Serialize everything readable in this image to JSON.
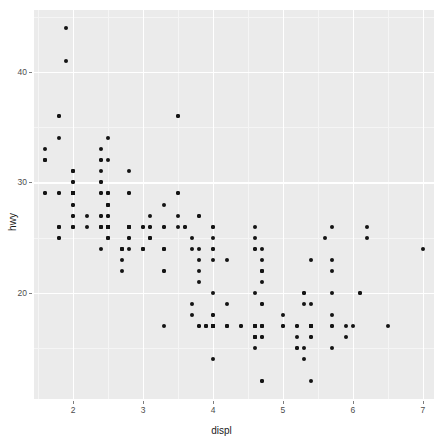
{
  "chart_data": {
    "type": "scatter",
    "title": "",
    "subtitle": "",
    "xlabel": "displ",
    "ylabel": "hwy",
    "xlim": [
      1.44,
      7.16
    ],
    "ylim": [
      10.4,
      45.6
    ],
    "xticks": [
      2,
      3,
      4,
      5,
      6,
      7
    ],
    "xtick_labels": [
      "2",
      "3",
      "4",
      "5",
      "6",
      "7"
    ],
    "yticks": [
      20,
      30,
      40
    ],
    "ytick_labels": [
      "20",
      "30",
      "40"
    ],
    "x_minor_ticks": [
      1.5,
      2.5,
      3.5,
      4.5,
      5.5,
      6.5
    ],
    "y_minor_ticks": [
      15,
      25,
      35,
      45
    ],
    "grid": true,
    "legend": "none",
    "point_color": "#141414",
    "panel_background": "#ebebeb",
    "gridline_color": "#ffffff",
    "figure_background": "#ffffff",
    "n_points": 234,
    "series_name": "mpg",
    "points": [
      [
        1.8,
        29
      ],
      [
        1.8,
        29
      ],
      [
        2.0,
        31
      ],
      [
        2.0,
        30
      ],
      [
        2.8,
        26
      ],
      [
        2.8,
        26
      ],
      [
        3.1,
        27
      ],
      [
        1.8,
        26
      ],
      [
        1.8,
        25
      ],
      [
        2.0,
        28
      ],
      [
        2.0,
        27
      ],
      [
        2.8,
        25
      ],
      [
        2.8,
        25
      ],
      [
        3.1,
        25
      ],
      [
        3.1,
        25
      ],
      [
        2.8,
        24
      ],
      [
        3.1,
        25
      ],
      [
        4.2,
        23
      ],
      [
        5.3,
        20
      ],
      [
        5.3,
        15
      ],
      [
        5.3,
        20
      ],
      [
        5.7,
        17
      ],
      [
        6.0,
        17
      ],
      [
        5.7,
        26
      ],
      [
        5.7,
        23
      ],
      [
        6.2,
        26
      ],
      [
        6.2,
        25
      ],
      [
        7.0,
        24
      ],
      [
        5.3,
        19
      ],
      [
        5.3,
        14
      ],
      [
        5.7,
        15
      ],
      [
        6.5,
        17
      ],
      [
        2.4,
        27
      ],
      [
        2.4,
        30
      ],
      [
        3.1,
        26
      ],
      [
        3.5,
        29
      ],
      [
        3.6,
        26
      ],
      [
        2.4,
        24
      ],
      [
        3.0,
        24
      ],
      [
        3.3,
        22
      ],
      [
        3.3,
        22
      ],
      [
        3.3,
        24
      ],
      [
        3.3,
        24
      ],
      [
        3.3,
        17
      ],
      [
        3.8,
        22
      ],
      [
        3.8,
        21
      ],
      [
        3.8,
        23
      ],
      [
        4.0,
        23
      ],
      [
        3.7,
        19
      ],
      [
        3.7,
        18
      ],
      [
        3.9,
        17
      ],
      [
        3.9,
        17
      ],
      [
        4.7,
        19
      ],
      [
        4.7,
        19
      ],
      [
        4.7,
        12
      ],
      [
        5.2,
        17
      ],
      [
        5.2,
        15
      ],
      [
        3.9,
        17
      ],
      [
        4.7,
        17
      ],
      [
        4.7,
        12
      ],
      [
        4.7,
        17
      ],
      [
        5.2,
        16
      ],
      [
        5.7,
        18
      ],
      [
        5.9,
        17
      ],
      [
        4.7,
        17
      ],
      [
        4.7,
        16
      ],
      [
        4.7,
        16
      ],
      [
        4.7,
        17
      ],
      [
        5.2,
        15
      ],
      [
        5.2,
        17
      ],
      [
        5.7,
        17
      ],
      [
        5.9,
        16
      ],
      [
        4.6,
        17
      ],
      [
        5.4,
        17
      ],
      [
        5.4,
        16
      ],
      [
        4.0,
        20
      ],
      [
        4.0,
        17
      ],
      [
        4.0,
        17
      ],
      [
        4.0,
        17
      ],
      [
        4.6,
        17
      ],
      [
        5.0,
        17
      ],
      [
        4.2,
        17
      ],
      [
        4.2,
        17
      ],
      [
        4.6,
        16
      ],
      [
        4.6,
        16
      ],
      [
        4.6,
        16
      ],
      [
        5.4,
        17
      ],
      [
        5.4,
        17
      ],
      [
        3.8,
        17
      ],
      [
        3.8,
        17
      ],
      [
        4.0,
        17
      ],
      [
        4.0,
        17
      ],
      [
        4.6,
        17
      ],
      [
        4.6,
        17
      ],
      [
        4.6,
        16
      ],
      [
        4.6,
        16
      ],
      [
        5.4,
        16
      ],
      [
        1.6,
        33
      ],
      [
        1.6,
        32
      ],
      [
        1.6,
        32
      ],
      [
        1.6,
        29
      ],
      [
        1.6,
        32
      ],
      [
        1.8,
        34
      ],
      [
        1.8,
        36
      ],
      [
        1.8,
        36
      ],
      [
        2.0,
        29
      ],
      [
        2.4,
        26
      ],
      [
        2.4,
        27
      ],
      [
        2.4,
        30
      ],
      [
        2.4,
        31
      ],
      [
        2.5,
        26
      ],
      [
        2.5,
        26
      ],
      [
        3.3,
        28
      ],
      [
        2.0,
        26
      ],
      [
        2.0,
        29
      ],
      [
        2.0,
        31
      ],
      [
        2.0,
        29
      ],
      [
        2.7,
        24
      ],
      [
        2.7,
        24
      ],
      [
        2.7,
        22
      ],
      [
        3.0,
        26
      ],
      [
        3.7,
        25
      ],
      [
        4.0,
        24
      ],
      [
        4.7,
        21
      ],
      [
        4.7,
        22
      ],
      [
        4.7,
        23
      ],
      [
        5.7,
        22
      ],
      [
        6.1,
        20
      ],
      [
        4.0,
        18
      ],
      [
        4.2,
        19
      ],
      [
        4.4,
        17
      ],
      [
        4.6,
        20
      ],
      [
        5.4,
        17
      ],
      [
        5.4,
        12
      ],
      [
        5.4,
        19
      ],
      [
        4.0,
        18
      ],
      [
        4.0,
        14
      ],
      [
        4.6,
        15
      ],
      [
        5.0,
        18
      ],
      [
        2.4,
        29
      ],
      [
        2.4,
        26
      ],
      [
        2.5,
        29
      ],
      [
        2.5,
        29
      ],
      [
        3.5,
        26
      ],
      [
        3.5,
        29
      ],
      [
        3.0,
        24
      ],
      [
        3.0,
        24
      ],
      [
        3.5,
        27
      ],
      [
        3.3,
        26
      ],
      [
        3.3,
        26
      ],
      [
        4.0,
        26
      ],
      [
        5.6,
        25
      ],
      [
        3.1,
        26
      ],
      [
        3.8,
        24
      ],
      [
        3.8,
        27
      ],
      [
        3.8,
        27
      ],
      [
        4.0,
        26
      ],
      [
        4.0,
        25
      ],
      [
        4.6,
        24
      ],
      [
        4.6,
        24
      ],
      [
        4.6,
        25
      ],
      [
        4.6,
        26
      ],
      [
        5.4,
        23
      ],
      [
        1.6,
        29
      ],
      [
        1.8,
        25
      ],
      [
        1.8,
        26
      ],
      [
        1.8,
        26
      ],
      [
        2.0,
        26
      ],
      [
        2.4,
        26
      ],
      [
        2.4,
        26
      ],
      [
        2.5,
        26
      ],
      [
        2.5,
        26
      ],
      [
        3.3,
        24
      ],
      [
        2.0,
        29
      ],
      [
        2.0,
        29
      ],
      [
        2.0,
        29
      ],
      [
        2.0,
        29
      ],
      [
        2.7,
        23
      ],
      [
        2.7,
        24
      ],
      [
        2.7,
        24
      ],
      [
        3.0,
        26
      ],
      [
        3.7,
        24
      ],
      [
        4.0,
        24
      ],
      [
        4.7,
        22
      ],
      [
        4.7,
        22
      ],
      [
        4.7,
        24
      ],
      [
        5.7,
        20
      ],
      [
        6.1,
        20
      ],
      [
        4.0,
        17
      ],
      [
        4.2,
        17
      ],
      [
        4.4,
        17
      ],
      [
        4.6,
        17
      ],
      [
        5.4,
        17
      ],
      [
        5.4,
        17
      ],
      [
        5.4,
        17
      ],
      [
        4.0,
        17
      ],
      [
        4.0,
        17
      ],
      [
        4.6,
        17
      ],
      [
        5.0,
        17
      ],
      [
        2.4,
        33
      ],
      [
        2.4,
        32
      ],
      [
        2.4,
        32
      ],
      [
        2.4,
        29
      ],
      [
        2.5,
        32
      ],
      [
        2.5,
        34
      ],
      [
        3.5,
        36
      ],
      [
        3.5,
        36
      ],
      [
        2.0,
        29
      ],
      [
        2.0,
        26
      ],
      [
        2.0,
        27
      ],
      [
        2.0,
        30
      ],
      [
        2.0,
        31
      ],
      [
        2.5,
        26
      ],
      [
        2.5,
        26
      ],
      [
        2.5,
        28
      ],
      [
        2.5,
        26
      ],
      [
        2.8,
        29
      ],
      [
        2.8,
        31
      ],
      [
        2.8,
        29
      ],
      [
        1.9,
        44
      ],
      [
        2.0,
        29
      ],
      [
        2.0,
        29
      ],
      [
        2.0,
        29
      ],
      [
        2.0,
        29
      ],
      [
        2.5,
        28
      ],
      [
        2.5,
        29
      ],
      [
        2.8,
        26
      ],
      [
        2.8,
        26
      ],
      [
        1.9,
        41
      ],
      [
        2.0,
        28
      ],
      [
        2.0,
        29
      ],
      [
        2.0,
        29
      ],
      [
        2.0,
        29
      ],
      [
        2.5,
        26
      ],
      [
        2.5,
        26
      ],
      [
        2.8,
        26
      ],
      [
        2.8,
        26
      ],
      [
        3.6,
        26
      ],
      [
        2.5,
        28
      ],
      [
        2.5,
        28
      ],
      [
        2.5,
        25
      ],
      [
        2.5,
        25
      ],
      [
        2.5,
        27
      ],
      [
        2.5,
        25
      ],
      [
        2.5,
        26
      ],
      [
        2.5,
        27
      ],
      [
        2.2,
        27
      ],
      [
        2.2,
        26
      ]
    ]
  },
  "layout": {
    "panel": {
      "left": 34,
      "top": 10,
      "right": 434,
      "bottom": 399
    }
  }
}
